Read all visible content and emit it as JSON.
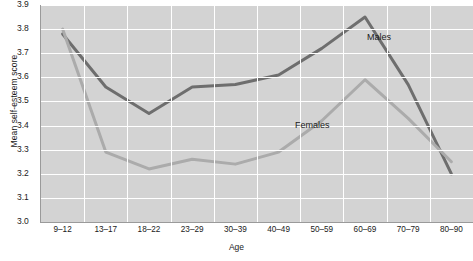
{
  "chart_data": {
    "type": "line",
    "title": "",
    "xlabel": "Age",
    "ylabel": "Mean self-esteem score",
    "categories": [
      "9–12",
      "13–17",
      "18–22",
      "23–29",
      "30–39",
      "40–49",
      "50–59",
      "60–69",
      "70–79",
      "80–90"
    ],
    "ylim": [
      3.0,
      3.9
    ],
    "ytick_labels": [
      "3.0",
      "3.1",
      "3.2",
      "3.3",
      "3.4",
      "3.5",
      "3.6",
      "3.7",
      "3.8",
      "3.9"
    ],
    "ytick_values": [
      3.0,
      3.1,
      3.2,
      3.3,
      3.4,
      3.5,
      3.6,
      3.7,
      3.8,
      3.9
    ],
    "grid": true,
    "legend_position": "inline-annotation",
    "series": [
      {
        "name": "Males",
        "color": "#6e6e6e",
        "values": [
          3.78,
          3.56,
          3.45,
          3.56,
          3.57,
          3.61,
          3.72,
          3.85,
          3.57,
          3.2
        ],
        "label_x": 367,
        "label_y": 32
      },
      {
        "name": "Females",
        "color": "#ababab",
        "values": [
          3.8,
          3.29,
          3.22,
          3.26,
          3.24,
          3.29,
          3.42,
          3.59,
          3.43,
          3.25
        ],
        "label_x": 295,
        "label_y": 120
      }
    ]
  },
  "axes": {
    "y_title": "Mean self-esteem score",
    "x_title": "Age"
  },
  "colors": {
    "plot_background": "#d3d3d3",
    "gridline": "#ffffff",
    "axis": "#9a9a9a",
    "males": "#6e6e6e",
    "females": "#ababab",
    "text": "#1a1a1a"
  }
}
